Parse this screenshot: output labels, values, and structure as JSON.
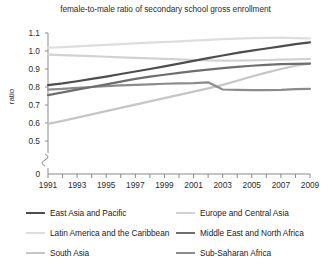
{
  "chart_data": {
    "type": "line",
    "title": "female-to-male ratio of secondary school gross enrollment",
    "xlabel": "",
    "ylabel": "ratio",
    "x": [
      1991,
      1992,
      1993,
      1994,
      1995,
      1996,
      1997,
      1998,
      1999,
      2000,
      2001,
      2002,
      2003,
      2004,
      2005,
      2006,
      2007,
      2008,
      2009
    ],
    "xlim": [
      1991,
      2009
    ],
    "ylim": [
      0.5,
      1.1
    ],
    "y_axis_has_break": true,
    "y_zero_label": "0",
    "xtick_labels": [
      "1991",
      "1993",
      "1995",
      "1997",
      "1999",
      "2001",
      "2003",
      "2005",
      "2007",
      "2009"
    ],
    "ytick_labels": [
      "0",
      "0.5",
      "0.6",
      "0.7",
      "0.8",
      "0.9",
      "1.0",
      "1.1"
    ],
    "grid": false,
    "legend_position": "below",
    "series": [
      {
        "name": "East Asia and Pacific",
        "color": "#4d4d4d",
        "values": [
          0.81,
          0.82,
          0.832,
          0.845,
          0.858,
          0.872,
          0.886,
          0.9,
          0.915,
          0.93,
          0.945,
          0.96,
          0.975,
          0.99,
          1.002,
          1.014,
          1.026,
          1.038,
          1.048
        ]
      },
      {
        "name": "Europe and Central Asia",
        "color": "#d2d2d2",
        "values": [
          0.98,
          0.977,
          0.974,
          0.971,
          0.968,
          0.965,
          0.962,
          0.959,
          0.956,
          0.953,
          0.95,
          0.948,
          0.947,
          0.947,
          0.948,
          0.95,
          0.952,
          0.954,
          0.956
        ]
      },
      {
        "name": "Latin America and the Caribbean",
        "color": "#dedede",
        "values": [
          1.018,
          1.022,
          1.026,
          1.03,
          1.034,
          1.038,
          1.042,
          1.046,
          1.05,
          1.054,
          1.058,
          1.062,
          1.066,
          1.069,
          1.071,
          1.073,
          1.074,
          1.072,
          1.07
        ]
      },
      {
        "name": "Middle East and North Africa",
        "color": "#6e6e6e",
        "values": [
          0.755,
          0.77,
          0.785,
          0.8,
          0.815,
          0.83,
          0.845,
          0.858,
          0.868,
          0.878,
          0.888,
          0.897,
          0.905,
          0.912,
          0.918,
          0.923,
          0.927,
          0.929,
          0.93
        ]
      },
      {
        "name": "South Asia",
        "color": "#c6c6c6",
        "values": [
          0.595,
          0.612,
          0.63,
          0.648,
          0.666,
          0.684,
          0.702,
          0.72,
          0.738,
          0.756,
          0.774,
          0.792,
          0.812,
          0.835,
          0.858,
          0.88,
          0.9,
          0.918,
          0.93
        ]
      },
      {
        "name": "Sub-Saharan Africa",
        "color": "#8c8c8c",
        "values": [
          0.785,
          0.79,
          0.795,
          0.8,
          0.805,
          0.809,
          0.812,
          0.815,
          0.818,
          0.82,
          0.822,
          0.826,
          0.786,
          0.784,
          0.783,
          0.783,
          0.784,
          0.788,
          0.79
        ]
      }
    ]
  },
  "legend": {
    "items": [
      {
        "label": "East Asia and Pacific"
      },
      {
        "label": "Europe and Central Asia"
      },
      {
        "label": "Latin America and the Caribbean"
      },
      {
        "label": "Middle East and North Africa"
      },
      {
        "label": "South Asia"
      },
      {
        "label": "Sub-Saharan Africa"
      }
    ]
  }
}
